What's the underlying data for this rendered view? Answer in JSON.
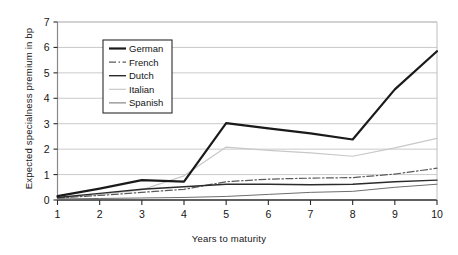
{
  "chart_data": {
    "type": "line",
    "title": "",
    "xlabel": "Years to maturity",
    "ylabel": "Expected specialness premium in bp",
    "x": [
      1,
      2,
      3,
      4,
      5,
      6,
      7,
      8,
      9,
      10
    ],
    "xlim": [
      1,
      10
    ],
    "ylim": [
      0,
      7
    ],
    "xticks": [
      "1",
      "2",
      "3",
      "4",
      "5",
      "6",
      "7",
      "8",
      "9",
      "10"
    ],
    "yticks": [
      "0",
      "1",
      "2",
      "3",
      "4",
      "5",
      "6",
      "7"
    ],
    "grid": true,
    "legend_position": "upper-left-inside",
    "series": [
      {
        "name": "German",
        "style": "solid-thick",
        "color": "#1a1a1a",
        "values": [
          0.15,
          0.45,
          0.78,
          0.72,
          3.02,
          2.82,
          2.62,
          2.38,
          4.35,
          5.85
        ]
      },
      {
        "name": "French",
        "style": "dash-dot",
        "color": "#5a5a5a",
        "values": [
          0.08,
          0.18,
          0.3,
          0.42,
          0.72,
          0.82,
          0.86,
          0.88,
          1.02,
          1.25
        ]
      },
      {
        "name": "Dutch",
        "style": "solid-medium",
        "color": "#2b2b2b",
        "values": [
          0.1,
          0.26,
          0.42,
          0.52,
          0.62,
          0.62,
          0.6,
          0.62,
          0.72,
          0.78
        ]
      },
      {
        "name": "Italian",
        "style": "solid-light",
        "color": "#c8c8c8",
        "values": [
          0.05,
          0.22,
          0.4,
          0.95,
          2.08,
          1.95,
          1.85,
          1.72,
          2.05,
          2.42
        ]
      },
      {
        "name": "Spanish",
        "style": "solid-thin",
        "color": "#6e6e6e",
        "values": [
          0.04,
          0.06,
          0.08,
          0.1,
          0.14,
          0.22,
          0.3,
          0.34,
          0.5,
          0.62
        ]
      }
    ]
  },
  "legend": {
    "entries": [
      {
        "label": "German"
      },
      {
        "label": "French"
      },
      {
        "label": "Dutch"
      },
      {
        "label": "Italian"
      },
      {
        "label": "Spanish"
      }
    ]
  }
}
